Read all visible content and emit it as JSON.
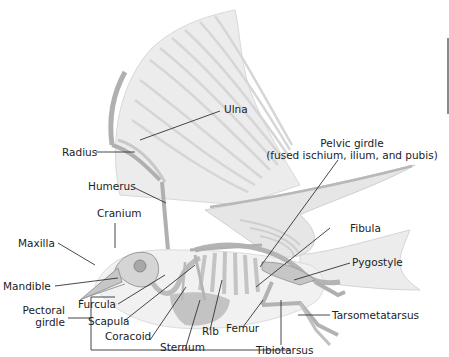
{
  "figure": {
    "colors": {
      "feather": "#ececec",
      "feather_shade": "#d4d4d4",
      "bone": "#c8c8c8",
      "bone_dark": "#9a9a9a",
      "body": "#f1f1f1",
      "sternum_shade": "#b5b5b5",
      "leader_line": "#333333",
      "text": "#222222"
    }
  },
  "labels": {
    "ulna": "Ulna",
    "radius": "Radius",
    "humerus": "Humerus",
    "cranium": "Cranium",
    "maxilla": "Maxilla",
    "mandible": "Mandible",
    "pectoral_girdle_line1": "Pectoral",
    "pectoral_girdle_line2": "girdle",
    "furcula": "Furcula",
    "scapula": "Scapula",
    "coracoid": "Coracoid",
    "sternum": "Sternum",
    "rib": "Rib",
    "femur": "Femur",
    "tibiotarsus": "Tibiotarsus",
    "tarsometatarsus": "Tarsometatarsus",
    "pygostyle": "Pygostyle",
    "fibula": "Fibula",
    "pelvic_girdle_line1": "Pelvic girdle",
    "pelvic_girdle_line2": "(fused ischium, ilium, and pubis)"
  }
}
